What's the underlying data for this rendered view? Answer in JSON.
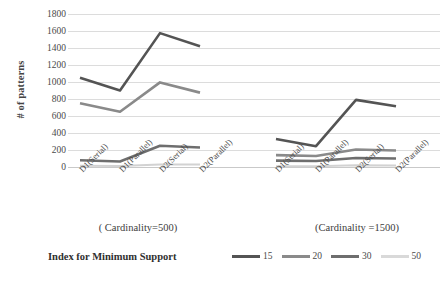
{
  "chart_data": {
    "type": "line",
    "title": "",
    "xlabel": "Index for Minimum Support",
    "ylabel": "# of patterns",
    "ylim": [
      0,
      1800
    ],
    "ytick_step": 200,
    "yticks": [
      1800,
      1600,
      1400,
      1200,
      1000,
      800,
      600,
      400,
      200,
      0
    ],
    "grid": true,
    "legend_position": "bottom-right",
    "legend_title": "Index for Minimum Support",
    "groups": [
      {
        "caption": "( Cardinality=500)",
        "categories": [
          "D1(Serial)",
          "D1(Parallel)",
          "D2(Serial)",
          "D2(Parallel)"
        ]
      },
      {
        "caption": "(Cardinality =1500)",
        "categories": [
          "D1(Serial)",
          "D1(Parallel)",
          "D2(Serial)",
          "D2(Parallel)"
        ]
      }
    ],
    "categories": [
      "D1(Serial)",
      "D1(Parallel)",
      "D2(Serial)",
      "D2(Parallel)",
      "D1(Serial)",
      "D1(Parallel)",
      "D2(Serial)",
      "D2(Parallel)"
    ],
    "series": [
      {
        "name": "15",
        "color": "#545454",
        "values_group1": [
          1050,
          900,
          1575,
          1420
        ],
        "values_group2": [
          330,
          245,
          790,
          715
        ]
      },
      {
        "name": "20",
        "color": "#8a8a8a",
        "values_group1": [
          750,
          650,
          995,
          875
        ],
        "values_group2": [
          140,
          130,
          205,
          195
        ]
      },
      {
        "name": "30",
        "color": "#6e6e6e",
        "values_group1": [
          80,
          65,
          250,
          230
        ],
        "values_group2": [
          75,
          70,
          105,
          100
        ]
      },
      {
        "name": "50",
        "color": "#d2d2d2",
        "values_group1": [
          15,
          12,
          30,
          28
        ],
        "values_group2": [
          10,
          10,
          20,
          18
        ]
      }
    ]
  },
  "legend": {
    "title": "Index for Minimum Support",
    "items": [
      {
        "label": "15",
        "color": "#545454"
      },
      {
        "label": "20",
        "color": "#8a8a8a"
      },
      {
        "label": "30",
        "color": "#6e6e6e"
      },
      {
        "label": "50",
        "color": "#d9d9d9"
      }
    ]
  },
  "axis": {
    "y_title": "# of patterns",
    "y_labels": [
      "1800",
      "1600",
      "1400",
      "1200",
      "1000",
      "800",
      "600",
      "400",
      "200",
      "0"
    ]
  },
  "captions": {
    "left": "( Cardinality=500)",
    "right": "(Cardinality =1500)"
  }
}
